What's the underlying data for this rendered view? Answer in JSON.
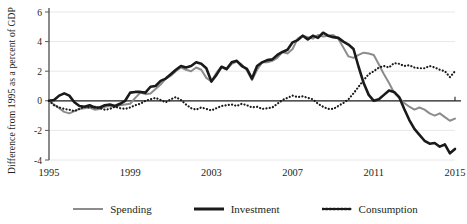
{
  "chart_data": {
    "type": "line",
    "title": "",
    "xlabel": "",
    "ylabel": "Difference from 1995 as a percent of GDP",
    "xlim": [
      1995,
      2015
    ],
    "ylim": [
      -4,
      6
    ],
    "yticks": [
      6,
      4,
      2,
      0,
      -2,
      -4
    ],
    "ytick_labels": [
      "6",
      "4",
      "2",
      "0",
      "-2",
      "-4"
    ],
    "xticks": [
      1995,
      1999,
      2003,
      2007,
      2011,
      2015
    ],
    "xtick_labels": [
      "1995",
      "1999",
      "2003",
      "2007",
      "2011",
      "2015"
    ],
    "grid": "horizontal",
    "legend_position": "bottom",
    "zero_line": 0,
    "x": [
      1995.0,
      1995.25,
      1995.5,
      1995.75,
      1996.0,
      1996.25,
      1996.5,
      1996.75,
      1997.0,
      1997.25,
      1997.5,
      1997.75,
      1998.0,
      1998.25,
      1998.5,
      1998.75,
      1999.0,
      1999.25,
      1999.5,
      1999.75,
      2000.0,
      2000.25,
      2000.5,
      2000.75,
      2001.0,
      2001.25,
      2001.5,
      2001.75,
      2002.0,
      2002.25,
      2002.5,
      2002.75,
      2003.0,
      2003.25,
      2003.5,
      2003.75,
      2004.0,
      2004.25,
      2004.5,
      2004.75,
      2005.0,
      2005.25,
      2005.5,
      2005.75,
      2006.0,
      2006.25,
      2006.5,
      2006.75,
      2007.0,
      2007.25,
      2007.5,
      2007.75,
      2008.0,
      2008.25,
      2008.5,
      2008.75,
      2009.0,
      2009.25,
      2009.5,
      2009.75,
      2010.0,
      2010.25,
      2010.5,
      2010.75,
      2011.0,
      2011.25,
      2011.5,
      2011.75,
      2012.0,
      2012.25,
      2012.5,
      2012.75,
      2013.0,
      2013.25,
      2013.5,
      2013.75,
      2014.0,
      2014.25,
      2014.5,
      2014.75,
      2015.0
    ],
    "series": [
      {
        "name": "Spending",
        "color": "#8c8c8c",
        "style": "solid",
        "width": 2.0,
        "values": [
          0.0,
          -0.25,
          -0.5,
          -0.75,
          -0.85,
          -0.7,
          -0.55,
          -0.5,
          -0.45,
          -0.6,
          -0.55,
          -0.4,
          -0.35,
          -0.4,
          -0.3,
          -0.25,
          -0.2,
          0.2,
          0.55,
          0.45,
          0.5,
          0.8,
          1.1,
          1.5,
          1.7,
          2.0,
          2.25,
          2.1,
          2.0,
          2.25,
          2.1,
          1.55,
          1.3,
          1.9,
          2.3,
          2.1,
          2.5,
          2.65,
          2.45,
          2.05,
          1.4,
          2.1,
          2.6,
          2.6,
          2.7,
          2.9,
          3.3,
          3.2,
          3.5,
          4.2,
          4.4,
          4.3,
          4.2,
          4.45,
          4.35,
          4.4,
          4.45,
          4.2,
          3.6,
          3.0,
          2.9,
          3.1,
          3.25,
          3.2,
          3.1,
          2.45,
          1.8,
          1.2,
          0.55,
          0.2,
          -0.15,
          -0.4,
          -0.6,
          -0.45,
          -0.6,
          -0.85,
          -1.0,
          -0.85,
          -1.1,
          -1.35,
          -1.2
        ]
      },
      {
        "name": "Investment",
        "color": "#1a1a1a",
        "style": "solid",
        "width": 2.6,
        "values": [
          0.0,
          0.05,
          0.35,
          0.5,
          0.35,
          -0.1,
          -0.35,
          -0.4,
          -0.3,
          -0.45,
          -0.45,
          -0.3,
          -0.25,
          -0.35,
          -0.2,
          0.0,
          0.55,
          0.6,
          0.6,
          0.55,
          0.95,
          1.0,
          1.35,
          1.5,
          1.8,
          2.1,
          2.35,
          2.25,
          2.35,
          2.6,
          2.5,
          2.2,
          1.3,
          1.75,
          2.3,
          2.15,
          2.6,
          2.7,
          2.35,
          2.15,
          1.5,
          2.35,
          2.6,
          2.75,
          2.8,
          3.1,
          3.3,
          3.45,
          3.95,
          4.1,
          4.4,
          4.15,
          4.4,
          4.25,
          4.6,
          4.4,
          4.3,
          4.25,
          4.0,
          3.8,
          3.5,
          2.3,
          1.2,
          0.4,
          0.0,
          0.1,
          0.4,
          0.7,
          0.6,
          0.25,
          -0.55,
          -1.3,
          -1.9,
          -2.3,
          -2.7,
          -2.9,
          -2.85,
          -3.1,
          -2.95,
          -3.55,
          -3.25
        ]
      },
      {
        "name": "Consumption",
        "color": "#1a1a1a",
        "style": "dotted",
        "width": 2.2,
        "values": [
          0.0,
          -0.3,
          -0.45,
          -0.55,
          -0.6,
          -0.7,
          -0.55,
          -0.4,
          -0.45,
          -0.4,
          -0.5,
          -0.6,
          -0.55,
          -0.4,
          -0.5,
          -0.55,
          -0.45,
          -0.3,
          -0.2,
          0.0,
          0.1,
          0.2,
          0.05,
          -0.1,
          0.1,
          0.25,
          0.05,
          -0.25,
          -0.5,
          -0.6,
          -0.45,
          -0.55,
          -0.65,
          -0.5,
          -0.35,
          -0.3,
          -0.25,
          -0.35,
          -0.2,
          -0.3,
          -0.45,
          -0.4,
          -0.55,
          -0.5,
          -0.45,
          -0.2,
          0.05,
          0.2,
          0.35,
          0.25,
          0.3,
          0.2,
          0.1,
          -0.2,
          -0.4,
          -0.55,
          -0.55,
          -0.35,
          -0.15,
          0.1,
          0.5,
          0.95,
          1.4,
          1.8,
          2.0,
          2.25,
          2.35,
          2.25,
          2.55,
          2.5,
          2.35,
          2.4,
          2.25,
          2.2,
          2.2,
          2.35,
          2.25,
          2.1,
          2.0,
          1.6,
          2.0
        ]
      }
    ]
  },
  "legend": {
    "items": [
      {
        "label": "Spending",
        "color": "#8c8c8c",
        "style": "solid"
      },
      {
        "label": "Investment",
        "color": "#1a1a1a",
        "style": "solid"
      },
      {
        "label": "Consumption",
        "color": "#1a1a1a",
        "style": "dotted"
      }
    ]
  },
  "axis": {
    "gridline_color": "#e8e8e8",
    "axis_color": "#595959"
  }
}
